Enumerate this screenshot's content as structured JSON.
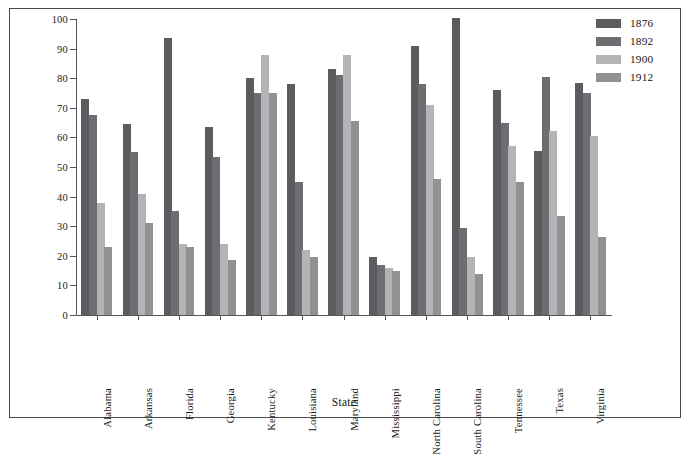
{
  "chart_data": {
    "type": "bar",
    "title": "",
    "xlabel": "State",
    "ylabel": "Percentage of Eligible Voters",
    "ylim": [
      0,
      100
    ],
    "ytick_step": 10,
    "yticks": [
      100,
      90,
      80,
      70,
      60,
      50,
      40,
      30,
      20,
      10,
      0
    ],
    "grid": false,
    "legend_position": "top-right",
    "categories": [
      "Alabama",
      "Arkansas",
      "Florida",
      "Georgia",
      "Kentucky",
      "Louisiana",
      "Maryland",
      "Mississippi",
      "North Carolina",
      "South Carolina",
      "Tennessee",
      "Texas",
      "Virginia"
    ],
    "series": [
      {
        "name": "1876",
        "color": "#5b5b60",
        "values": [
          73,
          64.5,
          93.5,
          63.5,
          80,
          78,
          83,
          19.5,
          91,
          100.5,
          76,
          55.5,
          78.5
        ]
      },
      {
        "name": "1892",
        "color": "#6e6e72",
        "values": [
          67.5,
          55,
          35,
          53.5,
          75,
          45,
          81,
          17,
          78,
          29.5,
          65,
          80.5,
          75
        ]
      },
      {
        "name": "1900",
        "color": "#b4b4b6",
        "values": [
          38,
          41,
          24,
          24,
          88,
          22,
          88,
          16,
          71,
          19.5,
          57,
          62,
          60.5
        ]
      },
      {
        "name": "1912",
        "color": "#919194",
        "values": [
          23,
          31,
          23,
          18.5,
          75,
          19.5,
          65.5,
          15,
          46,
          14,
          45,
          33.5,
          26.5
        ]
      }
    ]
  }
}
